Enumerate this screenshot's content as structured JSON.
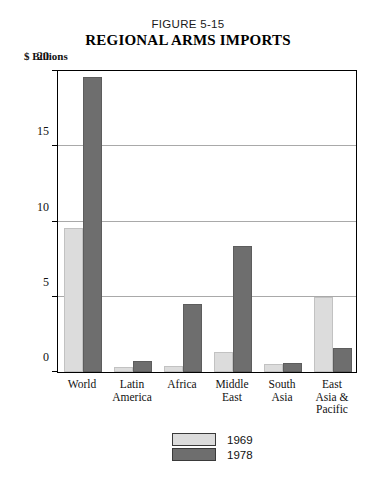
{
  "figure": {
    "number": "FIGURE 5-15",
    "title": "REGIONAL ARMS IMPORTS",
    "unit_label": "$ Billions"
  },
  "chart_data": {
    "type": "bar",
    "title": "REGIONAL ARMS IMPORTS",
    "subtitle": "FIGURE 5-15",
    "xlabel": "",
    "ylabel": "$ Billions",
    "ylim": [
      0,
      20
    ],
    "yticks": [
      0,
      5,
      10,
      15,
      20
    ],
    "ytick_labels": [
      "0",
      "5",
      "10",
      "15",
      "20"
    ],
    "grid": true,
    "legend_position": "bottom-center",
    "categories": [
      "World",
      "Latin America",
      "Africa",
      "Middle East",
      "South Asia",
      "East Asia & Pacific"
    ],
    "category_lines": [
      [
        "World"
      ],
      [
        "Latin",
        "America"
      ],
      [
        "Africa"
      ],
      [
        "Middle",
        "East"
      ],
      [
        "South",
        "Asia"
      ],
      [
        "East",
        "Asia &",
        "Pacific"
      ]
    ],
    "series": [
      {
        "name": "1969",
        "color": "#dcdcdc",
        "values": [
          9.6,
          0.35,
          0.4,
          1.3,
          0.5,
          5.0
        ]
      },
      {
        "name": "1978",
        "color": "#6e6e6e",
        "values": [
          19.6,
          0.75,
          4.55,
          8.35,
          0.6,
          1.6
        ]
      }
    ]
  },
  "legend": {
    "entries": [
      {
        "label": "1969",
        "color": "#dcdcdc"
      },
      {
        "label": "1978",
        "color": "#6e6e6e"
      }
    ]
  }
}
